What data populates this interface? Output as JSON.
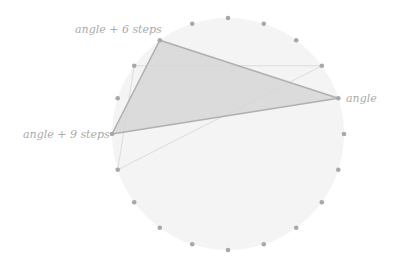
{
  "diagram": {
    "center": [
      228,
      134
    ],
    "radius": 116,
    "dot_count": 20,
    "colors": {
      "disc_fill": "#f4f4f4",
      "dot": "#a8a8a8",
      "triangle_fill": "#d6d6d6",
      "triangle_stroke": "#b0b0b0",
      "ghost_stroke": "#dcdcdc",
      "label": "#aaaaaa"
    },
    "labels": {
      "angle": "angle",
      "angle_6": "angle + 6 steps",
      "angle_9": "angle + 9 steps"
    },
    "triangle_indices": [
      4,
      18,
      15
    ],
    "ghost_triangle_indices": [
      3,
      17,
      14
    ]
  }
}
